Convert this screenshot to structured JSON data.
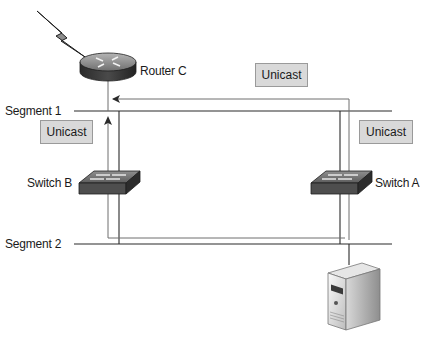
{
  "devices": {
    "router": {
      "label": "Router C",
      "icon": "router-icon"
    },
    "switch_b": {
      "label": "Switch B",
      "icon": "switch-icon"
    },
    "switch_a": {
      "label": "Switch A",
      "icon": "switch-icon"
    },
    "server": {
      "icon": "server-icon"
    },
    "wan_link": {
      "icon": "lightning-bolt-icon"
    }
  },
  "segments": [
    {
      "label": "Segment 1"
    },
    {
      "label": "Segment 2"
    }
  ],
  "frames": [
    {
      "label": "Unicast",
      "position": "top-center"
    },
    {
      "label": "Unicast",
      "position": "left"
    },
    {
      "label": "Unicast",
      "position": "right"
    }
  ],
  "colors": {
    "line": "#2a2a2a",
    "path_line": "#6e6e6e",
    "box_fill": "#d9d9d9",
    "device_dark": "#3a3a3a",
    "device_top": "#8a8a8a"
  }
}
